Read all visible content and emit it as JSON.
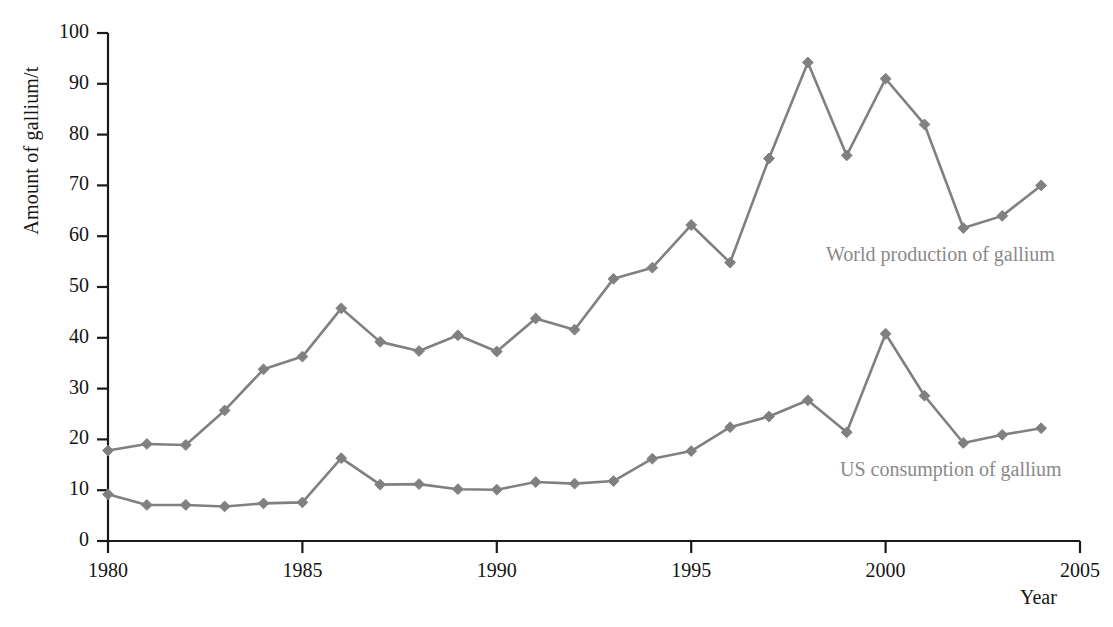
{
  "chart_data": {
    "type": "line",
    "title": "",
    "xlabel": "Year",
    "ylabel": "Amount of gallium/t",
    "xlim": [
      1980,
      2005
    ],
    "ylim": [
      0,
      100
    ],
    "xticks": [
      1980,
      1985,
      1990,
      1995,
      2000,
      2005
    ],
    "yticks": [
      0,
      10,
      20,
      30,
      40,
      50,
      60,
      70,
      80,
      90,
      100
    ],
    "grid": false,
    "legend_position": "inline-annotation",
    "marker": "diamond",
    "series_color": "#808080",
    "axis_color": "#1a1a1a",
    "x": [
      1980,
      1981,
      1982,
      1983,
      1984,
      1985,
      1986,
      1987,
      1988,
      1989,
      1990,
      1991,
      1992,
      1993,
      1994,
      1995,
      1996,
      1997,
      1998,
      1999,
      2000,
      2001,
      2002,
      2003,
      2004
    ],
    "series": [
      {
        "name": "World production of gallium",
        "values": [
          17.8,
          19.1,
          18.9,
          25.7,
          33.8,
          36.3,
          45.8,
          39.2,
          37.4,
          40.5,
          37.3,
          43.8,
          41.6,
          51.6,
          53.8,
          62.2,
          54.8,
          75.3,
          94.2,
          75.9,
          91.0,
          82.0,
          61.6,
          64.0,
          70.0
        ]
      },
      {
        "name": "US consumption of gallium",
        "values": [
          9.2,
          7.1,
          7.1,
          6.8,
          7.4,
          7.6,
          16.3,
          11.1,
          11.2,
          10.2,
          10.1,
          11.6,
          11.3,
          11.8,
          16.2,
          17.7,
          22.4,
          24.5,
          27.7,
          21.4,
          40.8,
          28.6,
          19.3,
          20.9,
          22.2
        ]
      }
    ],
    "annotations": [
      {
        "text": "World production of gallium",
        "x_px": 826,
        "y_px": 243
      },
      {
        "text": "US consumption of gallium",
        "x_px": 840,
        "y_px": 458
      }
    ]
  },
  "axis": {
    "y_title": "Amount of gallium/t",
    "x_title": "Year",
    "y_tick_labels": [
      "100",
      "90",
      "80",
      "70",
      "60",
      "50",
      "40",
      "30",
      "20",
      "10",
      "0"
    ],
    "x_tick_labels": [
      "1980",
      "1985",
      "1990",
      "1995",
      "2000",
      "2005"
    ]
  }
}
